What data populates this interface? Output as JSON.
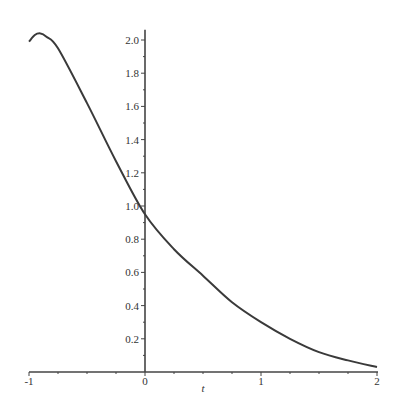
{
  "chart_data": {
    "type": "line",
    "title": "",
    "xlabel": "t",
    "ylabel": "",
    "xlim": [
      -1,
      2
    ],
    "ylim": [
      0,
      2.05
    ],
    "grid": false,
    "legend": null,
    "x_ticks": [
      "-1",
      "0",
      "1",
      "2"
    ],
    "y_ticks": [
      "0.2",
      "0.4",
      "0.6",
      "0.8",
      "1.0",
      "1.2",
      "1.4",
      "1.6",
      "1.8",
      "2.0"
    ],
    "series": [
      {
        "name": "curve",
        "x": [
          -1.0,
          -0.95,
          -0.9,
          -0.85,
          -0.75,
          -0.5,
          -0.25,
          0.0,
          0.25,
          0.5,
          0.75,
          1.0,
          1.25,
          1.5,
          1.75,
          2.0
        ],
        "y": [
          1.99,
          2.03,
          2.04,
          2.02,
          1.95,
          1.62,
          1.27,
          0.95,
          0.74,
          0.58,
          0.42,
          0.3,
          0.2,
          0.12,
          0.07,
          0.03
        ]
      }
    ]
  },
  "colors": {
    "curve": "#3a3a3a",
    "axis": "#444444"
  }
}
